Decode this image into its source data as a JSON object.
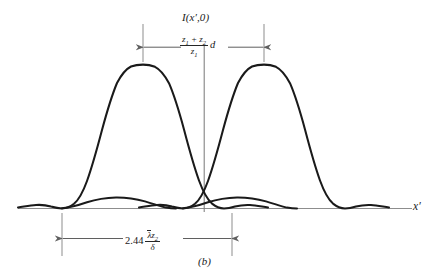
{
  "figure": {
    "caption": "(b)",
    "vertical_axis_label": "I(x′,0)",
    "horizontal_axis_label": "x′",
    "background_color": "#ffffff",
    "curve_color": "#1a1a1a",
    "annotation_color": "#6b6b6b"
  },
  "dimensions": {
    "top": {
      "name": "peak-separation",
      "prefix": "",
      "fraction_numerator": "z₁ + z₂",
      "fraction_denominator": "z₁",
      "suffix": "d",
      "full_text": "(z₁ + z₂)/z₁ · d"
    },
    "bottom": {
      "name": "airy-disk-diameter",
      "prefix": "2.44",
      "fraction_numerator": "λ̄z₂",
      "fraction_denominator": "δ",
      "suffix": "",
      "full_text": "2.44 λ̄z₂/δ"
    }
  },
  "chart_data": {
    "type": "line",
    "title": "",
    "xlabel": "x′",
    "ylabel": "I(x′,0)",
    "series": [
      {
        "name": "airy-pattern-left",
        "peak_x": 143,
        "peak_value": 1.0,
        "first_zero_offset": 81,
        "sidelobe_peak_value": 0.0175
      },
      {
        "name": "airy-pattern-right",
        "peak_x": 264,
        "peak_value": 1.0,
        "first_zero_offset": 81,
        "sidelobe_peak_value": 0.0175
      }
    ],
    "markers": {
      "center_axis_x": 204,
      "left_peak_x": 143,
      "right_peak_x": 264,
      "left_zero_x": 62,
      "right_zero_x": 232,
      "baseline_y": 208
    },
    "grid": false,
    "legend": false
  }
}
